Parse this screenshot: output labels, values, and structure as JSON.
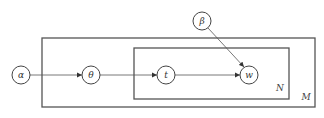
{
  "diagram": {
    "type": "plate-notation",
    "nodes": [
      {
        "id": "alpha",
        "label": "α",
        "cx": 21,
        "cy": 75
      },
      {
        "id": "theta",
        "label": "θ",
        "cx": 91,
        "cy": 75
      },
      {
        "id": "t",
        "label": "t",
        "cx": 166,
        "cy": 75
      },
      {
        "id": "w",
        "label": "w",
        "cx": 249,
        "cy": 75
      },
      {
        "id": "beta",
        "label": "β",
        "cx": 202,
        "cy": 21
      }
    ],
    "edges": [
      {
        "from": "alpha",
        "to": "theta"
      },
      {
        "from": "theta",
        "to": "t"
      },
      {
        "from": "t",
        "to": "w"
      },
      {
        "from": "beta",
        "to": "w"
      }
    ],
    "plates": [
      {
        "id": "outer",
        "label": "M"
      },
      {
        "id": "inner",
        "label": "N"
      }
    ]
  }
}
